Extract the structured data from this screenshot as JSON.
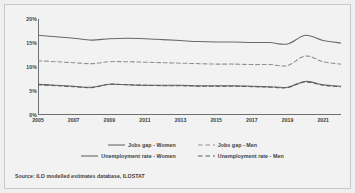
{
  "chart_data": {
    "type": "line",
    "title": "",
    "xlabel": "",
    "ylabel": "",
    "xlim": [
      2005,
      2022
    ],
    "ylim": [
      0,
      20
    ],
    "grid": false,
    "legend_position": "bottom",
    "y_ticks": [
      "0%",
      "5%",
      "10%",
      "15%",
      "20%"
    ],
    "y_tick_values": [
      0,
      5,
      10,
      15,
      20
    ],
    "x_ticks": [
      "2005",
      "2007",
      "2009",
      "2011",
      "2013",
      "2015",
      "2017",
      "2019",
      "2021"
    ],
    "x_tick_values": [
      2005,
      2007,
      2009,
      2011,
      2013,
      2015,
      2017,
      2019,
      2021
    ],
    "x": [
      2005,
      2006,
      2007,
      2008,
      2009,
      2010,
      2011,
      2012,
      2013,
      2014,
      2015,
      2016,
      2017,
      2018,
      2019,
      2020,
      2021,
      2022
    ],
    "series": [
      {
        "name": "Jobs gap - Women",
        "style": "solid",
        "color": "#6a6a6a",
        "values": [
          16.6,
          16.3,
          16.0,
          15.6,
          15.9,
          16.0,
          15.9,
          15.7,
          15.5,
          15.3,
          15.2,
          15.2,
          15.1,
          15.1,
          14.8,
          16.6,
          15.5,
          15.0
        ]
      },
      {
        "name": "Jobs gap - Men",
        "style": "dashed",
        "color": "#8f8f8f",
        "values": [
          11.3,
          11.1,
          10.9,
          10.7,
          11.1,
          11.1,
          11.0,
          10.9,
          10.8,
          10.7,
          10.6,
          10.6,
          10.5,
          10.5,
          10.3,
          12.3,
          11.1,
          10.6
        ]
      },
      {
        "name": "Unemployment rate - Women",
        "style": "solid",
        "color": "#6a6a6a",
        "values": [
          6.4,
          6.2,
          6.0,
          5.8,
          6.4,
          6.3,
          6.2,
          6.2,
          6.2,
          6.1,
          6.1,
          6.1,
          6.0,
          5.9,
          5.8,
          7.0,
          6.3,
          6.0
        ]
      },
      {
        "name": "Unemployment rate - Men",
        "style": "dashed",
        "color": "#5a5a5a",
        "values": [
          6.3,
          6.1,
          5.9,
          5.7,
          6.4,
          6.3,
          6.2,
          6.1,
          6.1,
          6.0,
          6.0,
          6.0,
          5.9,
          5.8,
          5.7,
          6.9,
          6.2,
          5.9
        ]
      }
    ]
  },
  "source": {
    "note": "Source: ILO modelled estimates database, ILOSTAT"
  },
  "colors": {
    "background": "#efefef",
    "plot_background": "#f2f2f2",
    "axis": "#6f6f6f",
    "text": "#3d3d3d",
    "border": "#c9c9c9"
  }
}
